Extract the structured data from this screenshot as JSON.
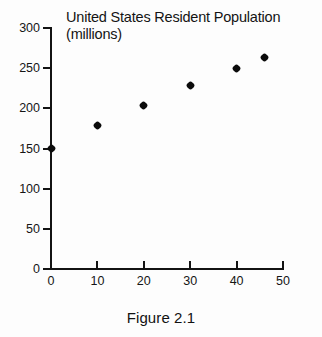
{
  "chart_data": {
    "type": "scatter",
    "title": "United States Resident Population\n(millions)",
    "title_line1": "United States Resident Population",
    "title_line2": "(millions)",
    "xlabel": "",
    "ylabel": "",
    "xlim": [
      0,
      50
    ],
    "ylim": [
      0,
      300
    ],
    "grid": false,
    "legend": "none",
    "x_ticks": [
      "0",
      "10",
      "20",
      "30",
      "40",
      "50"
    ],
    "x_tick_values": [
      0,
      10,
      20,
      30,
      40,
      50
    ],
    "y_ticks": [
      "0",
      "50",
      "100",
      "150",
      "200",
      "250",
      "300"
    ],
    "y_tick_values": [
      0,
      50,
      100,
      150,
      200,
      250,
      300
    ],
    "x": [
      0,
      10,
      20,
      30,
      40,
      46
    ],
    "values": [
      150,
      179,
      204,
      228,
      249,
      263
    ],
    "points": [
      {
        "x": 0,
        "y": 150
      },
      {
        "x": 10,
        "y": 179
      },
      {
        "x": 20,
        "y": 204
      },
      {
        "x": 30,
        "y": 228
      },
      {
        "x": 40,
        "y": 249
      },
      {
        "x": 46,
        "y": 263
      }
    ],
    "marker_color": "#0b0b0b",
    "axis_color": "#131313"
  },
  "caption": {
    "text": "Figure 2.1"
  }
}
